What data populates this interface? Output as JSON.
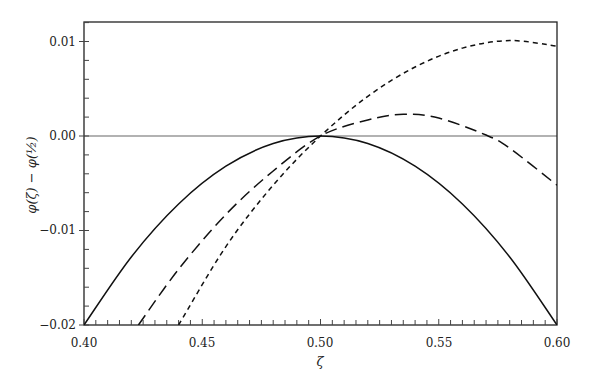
{
  "chart_data": {
    "type": "line",
    "title": "",
    "xlabel": "ζ",
    "ylabel": "φ(ζ) − φ(½)",
    "xlim": [
      0.4,
      0.6
    ],
    "ylim": [
      -0.02,
      0.0121
    ],
    "x_ticks": [
      "0.40",
      "0.45",
      "0.50",
      "0.55",
      "0.60"
    ],
    "y_ticks": [
      "0.01",
      "0.00",
      "-0.01",
      "-0.02"
    ],
    "grid": false,
    "legend": null,
    "reference_line": {
      "y": 0.0,
      "color": "#999999"
    },
    "series": [
      {
        "name": "solid",
        "style": "solid",
        "x": [
          0.4,
          0.42,
          0.44,
          0.46,
          0.48,
          0.5,
          0.52,
          0.54,
          0.56,
          0.58,
          0.6
        ],
        "y": [
          -0.02,
          -0.0128,
          -0.0072,
          -0.0032,
          -0.0008,
          0.0,
          -0.0008,
          -0.0032,
          -0.0072,
          -0.0128,
          -0.02
        ]
      },
      {
        "name": "long-dashed",
        "style": "long-dash",
        "x": [
          0.423,
          0.44,
          0.46,
          0.48,
          0.5,
          0.52,
          0.535,
          0.55,
          0.57,
          0.58,
          0.6
        ],
        "y": [
          -0.02,
          -0.0141,
          -0.0083,
          -0.0037,
          0.0,
          0.0017,
          0.0023,
          0.0019,
          0.0001,
          -0.0013,
          -0.0052
        ]
      },
      {
        "name": "short-dashed",
        "style": "short-dash",
        "x": [
          0.44,
          0.46,
          0.48,
          0.5,
          0.52,
          0.54,
          0.56,
          0.58,
          0.6
        ],
        "y": [
          -0.02,
          -0.0117,
          -0.0052,
          0.0,
          0.0042,
          0.0073,
          0.0093,
          0.0101,
          0.0095
        ]
      }
    ]
  }
}
